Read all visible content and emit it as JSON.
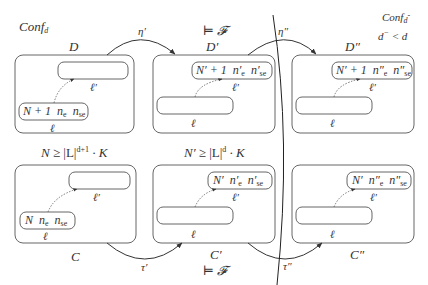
{
  "title_left": "Conf_d",
  "title_right": {
    "line1": "Conf_{d^-}",
    "line2": "d^- < d"
  },
  "colors": {
    "stroke": "#555555",
    "text": "#333333",
    "background": "#ffffff"
  },
  "top_row": {
    "boxes": [
      {
        "id": "D",
        "label": "D",
        "inner_node_text": {
          "N": "N + 1",
          "ne": "n",
          "ne_sub": "e",
          "nse": "n",
          "nse_sub": "se"
        },
        "lower_label": "ℓ",
        "upper_label": "ℓ′"
      },
      {
        "id": "D_prime",
        "label": "D′",
        "above_label": "⊨ 𝓕",
        "inner_node_text": {
          "N": "N′ + 1",
          "ne": "n′",
          "ne_sub": "e",
          "nse": "n′",
          "nse_sub": "se"
        },
        "lower_label": "ℓ",
        "upper_label": "ℓ′"
      },
      {
        "id": "D_dprime",
        "label": "D″",
        "inner_node_text": {
          "N": "N′ + 1",
          "ne": "n″",
          "ne_sub": "e",
          "nse": "n″",
          "nse_sub": "se"
        },
        "lower_label": "ℓ",
        "upper_label": "ℓ′"
      }
    ],
    "arrows": [
      {
        "from": "D",
        "to": "D_prime",
        "label": "η′"
      },
      {
        "from": "D_prime",
        "to": "D_dprime",
        "label": "η″"
      }
    ]
  },
  "conditions": {
    "left": {
      "lhs": "N",
      "rel": " ≥ |L|",
      "exp": "d+1",
      "rest": " · K"
    },
    "middle": {
      "lhs": "N′",
      "rel": " ≥ |L|",
      "exp": "d",
      "rest": " · K"
    }
  },
  "bottom_row": {
    "boxes": [
      {
        "id": "C",
        "label": "C",
        "inner_node_text": {
          "N": "N",
          "ne": "n",
          "ne_sub": "e",
          "nse": "n",
          "nse_sub": "se"
        },
        "lower_label": "ℓ",
        "upper_label": "ℓ′"
      },
      {
        "id": "C_prime",
        "label": "C′",
        "below_label": "⊨ 𝓕",
        "inner_node_text": {
          "N": "N′",
          "ne": "n′",
          "ne_sub": "e",
          "nse": "n′",
          "nse_sub": "se"
        },
        "lower_label": "ℓ",
        "upper_label": "ℓ′"
      },
      {
        "id": "C_dprime",
        "label": "C″",
        "inner_node_text": {
          "N": "N′",
          "ne": "n″",
          "ne_sub": "e",
          "nse": "n″",
          "nse_sub": "se"
        },
        "lower_label": "ℓ",
        "upper_label": "ℓ′"
      }
    ],
    "arrows": [
      {
        "from": "C",
        "to": "C_prime",
        "label": "τ′"
      },
      {
        "from": "C_prime",
        "to": "C_dprime",
        "label": "τ″"
      }
    ]
  }
}
